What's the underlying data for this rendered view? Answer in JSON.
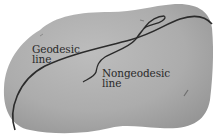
{
  "figure": {
    "surface": {
      "description": "curved potato-shaped surface",
      "fill": "#a9a9a9"
    },
    "line_color": "#2b2b2b",
    "labels": {
      "geodesic": {
        "line1": "Geodesic",
        "line2": "line"
      },
      "nongeodesic": {
        "line1": "Nongeodesic",
        "line2": "line"
      }
    }
  }
}
